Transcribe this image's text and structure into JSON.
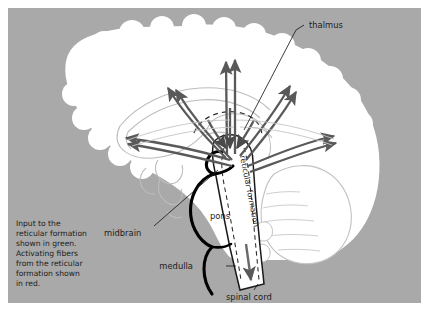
{
  "figure": {
    "background_color": "#a9a9a9",
    "brain_color": "#ffffff",
    "arrow_color": "#595959",
    "outline_color": "#111111",
    "faint_outline_color": "#b9b9b9"
  },
  "labels": {
    "thalmus": "thalmus",
    "pons": "pons",
    "midbrain": "midbrain",
    "medulla": "medulla",
    "spinal_cord": "spinal cord",
    "reticular_formation": "reticular formation"
  },
  "caption": {
    "line1": "Input to the",
    "line2": "reticular formation",
    "line3": "shown in green.",
    "line4": "Activating fibers",
    "line5": "from the reticular",
    "line6": "formation shown",
    "line7": "in red."
  }
}
